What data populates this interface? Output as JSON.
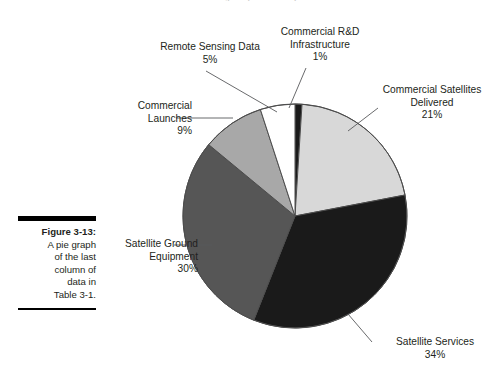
{
  "page": {
    "running_head": "IC Technologies Optical Microsystems"
  },
  "caption": {
    "figure_label": "Figure 3-13:",
    "lines": [
      "A pie graph",
      "of the last",
      "column of",
      "data in",
      "Table 3-1."
    ]
  },
  "chart_data": {
    "type": "pie",
    "title": "",
    "xlabel": "",
    "ylabel": "",
    "legend_position": "callout-labels",
    "grid": false,
    "start_angle_deg": 0,
    "direction": "clockwise",
    "center": {
      "x": 295,
      "y": 216
    },
    "radius": 112,
    "categories": [
      "Commercial R&D Infrastructure",
      "Commercial Satellites Delivered",
      "Satellite Services",
      "Satellite Ground Equipment",
      "Commercial Launches",
      "Remote Sensing Data"
    ],
    "values": [
      1,
      21,
      34,
      30,
      9,
      5
    ],
    "value_suffix": "%",
    "colors": [
      "#1a1a1a",
      "#d8d8d8",
      "#1a1a1a",
      "#565656",
      "#a8a8a8",
      "#ffffff"
    ],
    "slice_outline": "#4d4d4d",
    "slices": [
      {
        "name": "Commercial R&D Infrastructure",
        "value": 1,
        "label": "1%",
        "color": "#1a1a1a"
      },
      {
        "name": "Commercial Satellites Delivered",
        "value": 21,
        "label": "21%",
        "color": "#d8d8d8"
      },
      {
        "name": "Satellite Services",
        "value": 34,
        "label": "34%",
        "color": "#1a1a1a"
      },
      {
        "name": "Satellite Ground Equipment",
        "value": 30,
        "label": "30%",
        "color": "#565656"
      },
      {
        "name": "Commercial Launches",
        "value": 9,
        "label": "9%",
        "color": "#a8a8a8"
      },
      {
        "name": "Remote Sensing Data",
        "value": 5,
        "label": "5%",
        "color": "#ffffff"
      }
    ]
  },
  "labels": {
    "remote_sensing": {
      "line1": "Remote Sensing Data",
      "line2": "5%"
    },
    "commercial_rnd": {
      "line1": "Commercial R&D",
      "line2": "Infrastructure",
      "line3": "1%"
    },
    "commercial_satellites": {
      "line1": "Commercial Satellites",
      "line2": "Delivered",
      "line3": "21%"
    },
    "commercial_launches": {
      "line1": "Commercial",
      "line2": "Launches",
      "line3": "9%"
    },
    "satellite_ground": {
      "line1": "Satellite Ground",
      "line2": "Equipment",
      "line3": "30%"
    },
    "satellite_services": {
      "line1": "Satellite Services",
      "line2": "34%"
    }
  }
}
